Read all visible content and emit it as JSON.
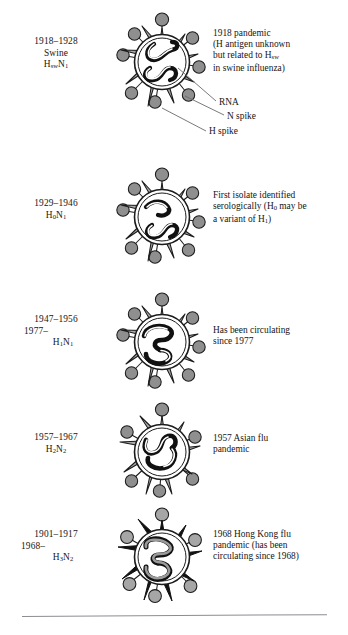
{
  "figure": {
    "colors": {
      "h_spike_gray": "#a9a9a9",
      "h_spike_black": "#111111",
      "n_spike_gray": "#8f8f8f",
      "envelope_white": "#ffffff",
      "rna_black": "#111111",
      "rna_gray": "#9a9a9a",
      "outline": "#1b1b1b",
      "text": "#161616",
      "rule": "#8c8c93"
    },
    "rows": [
      {
        "id": "row-1918",
        "left_lines": [
          "1918–1928",
          "Swine",
          "H<sub>sw</sub>N<sub>1</sub>"
        ],
        "note_lines": [
          "1918 pandemic",
          "(H antigen unknown",
          "but related to H<sub>sw</sub>",
          "in swine influenza)"
        ],
        "h_spike_color": "#a9a9a9",
        "rna_style": "black-outline-white"
      },
      {
        "id": "row-1929",
        "left_lines": [
          "1929–1946",
          "H<sub>0</sub>N<sub>1</sub>"
        ],
        "note_lines": [
          "First isolate identified",
          "serologically (H<sub>0</sub> may be",
          "a variant of H<sub>1</sub>)"
        ],
        "h_spike_color": "#a9a9a9",
        "rna_style": "black-outline-white"
      },
      {
        "id": "row-1947",
        "left_lines": [
          "1947–1956",
          "1977–",
          "H<sub>1</sub>N<sub>1</sub>"
        ],
        "note_lines": [
          "Has been circulating",
          "since 1977"
        ],
        "h_spike_color": "#a9a9a9",
        "rna_style": "black-outline-white"
      },
      {
        "id": "row-1957",
        "left_lines": [
          "1957–1967",
          "H<sub>2</sub>N<sub>2</sub>"
        ],
        "note_lines": [
          "1957 Asian flu",
          "pandemic"
        ],
        "h_spike_color": "#a9a9a9",
        "rna_style": "black-outline-white"
      },
      {
        "id": "row-1901",
        "left_lines": [
          "1901–1917",
          "1968–",
          "H<sub>3</sub>N<sub>2</sub>"
        ],
        "note_lines": [
          "1968 Hong Kong flu",
          "pandemic (has been",
          "circulating since 1968)"
        ],
        "h_spike_color": "#111111",
        "rna_style": "gray-fill-black-outline"
      }
    ],
    "callouts": [
      {
        "id": "callout-rna",
        "label": "RNA"
      },
      {
        "id": "callout-n-spike",
        "label": "N spike"
      },
      {
        "id": "callout-h-spike",
        "label": "H spike"
      }
    ]
  }
}
